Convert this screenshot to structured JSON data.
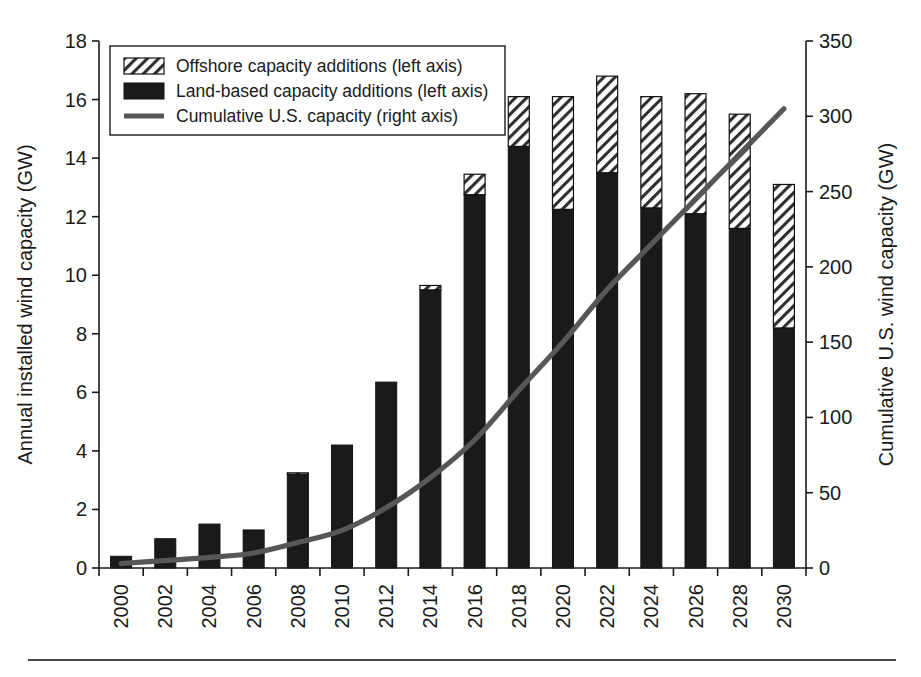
{
  "figure": {
    "axis_left_title": "Annual installed wind capacity (GW)",
    "axis_right_title": "Cumulative U.S. wind capacity (GW)",
    "colors": {
      "land_based": "#1a1a1a",
      "offshore_hatch": "#2a2a2a",
      "offshore_fill": "#ffffff",
      "line": "#575757",
      "axis": "#1a1a1a",
      "footer_rule": "#4a4a4a"
    }
  },
  "legend": {
    "items": [
      {
        "label": "Offshore capacity additions (left axis)",
        "swatch": "hatched"
      },
      {
        "label": "Land-based capacity additions (left axis)",
        "swatch": "solid-black"
      },
      {
        "label": "Cumulative U.S. capacity (right axis)",
        "swatch": "line"
      }
    ]
  },
  "chart_data": {
    "type": "bar",
    "title": "",
    "xlabel": "",
    "ylabel": "Annual installed wind capacity (GW)",
    "y2label": "Cumulative U.S. wind capacity (GW)",
    "grid": false,
    "legend_position": "top-left",
    "stacked": true,
    "categories": [
      "2000",
      "2002",
      "2004",
      "2006",
      "2008",
      "2010",
      "2012",
      "2014",
      "2016",
      "2018",
      "2020",
      "2022",
      "2024",
      "2026",
      "2028",
      "2030"
    ],
    "ylim": [
      0,
      18
    ],
    "yticks": [
      0,
      2,
      4,
      6,
      8,
      10,
      12,
      14,
      16,
      18
    ],
    "ytick_labels": [
      "0",
      "2",
      "4",
      "6",
      "8",
      "10",
      "12",
      "14",
      "16",
      "18"
    ],
    "y2lim": [
      0,
      350
    ],
    "y2ticks": [
      0,
      50,
      100,
      150,
      200,
      250,
      300,
      350
    ],
    "y2tick_labels": [
      "0",
      "50",
      "100",
      "150",
      "200",
      "250",
      "300",
      "350"
    ],
    "xtick_labels": [
      "2000",
      "2002",
      "2004",
      "2006",
      "2008",
      "2010",
      "2012",
      "2014",
      "2016",
      "2018",
      "2020",
      "2022",
      "2024",
      "2026",
      "2028",
      "2030"
    ],
    "series": [
      {
        "name": "Land-based capacity additions (left axis)",
        "axis": "left",
        "type": "bar",
        "values": [
          0.4,
          1.0,
          1.5,
          1.3,
          3.2,
          4.2,
          6.35,
          9.5,
          12.75,
          14.4,
          12.25,
          13.5,
          12.3,
          12.1,
          11.6,
          8.2
        ]
      },
      {
        "name": "Offshore capacity additions (left axis)",
        "axis": "left",
        "type": "bar",
        "values": [
          0.0,
          0.0,
          0.0,
          0.0,
          0.05,
          0.0,
          0.0,
          0.15,
          0.7,
          1.7,
          3.85,
          3.3,
          3.8,
          4.1,
          3.9,
          4.9
        ]
      },
      {
        "name": "Cumulative U.S. capacity (right axis)",
        "axis": "right",
        "type": "line",
        "values": [
          3,
          5,
          7,
          10,
          17,
          25,
          40,
          60,
          85,
          118,
          150,
          185,
          215,
          245,
          275,
          305
        ]
      }
    ],
    "totals": [
      0.4,
      1.0,
      1.5,
      1.3,
      3.25,
      4.2,
      6.35,
      9.65,
      13.45,
      16.1,
      16.1,
      16.8,
      16.1,
      16.2,
      15.5,
      13.1
    ]
  }
}
